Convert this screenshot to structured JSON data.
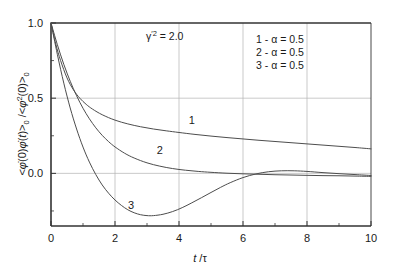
{
  "chart_data": {
    "type": "line",
    "title": "",
    "xlabel": "t/τ",
    "ylabel": "<φ̇(0)φ̇(t)>₀ / <φ̇²(0)>₀",
    "xlim": [
      0,
      10
    ],
    "ylim": [
      -0.35,
      1.0
    ],
    "grid": true,
    "x_ticks": [
      "0",
      "2",
      "4",
      "6",
      "8",
      "10"
    ],
    "x_tick_values": [
      0,
      2,
      4,
      6,
      8,
      10
    ],
    "y_ticks": [
      "0.0",
      "0.5",
      "1.0"
    ],
    "y_tick_values": [
      0.0,
      0.5,
      1.0
    ],
    "y_minor_ticks": [
      -0.25,
      0.25,
      0.75
    ],
    "annotations": [
      {
        "name": "gamma-prime-squared",
        "text": "γ'² = 2.0",
        "x": 2.2,
        "y": 0.87
      },
      {
        "name": "curve-tag-1",
        "text": "1",
        "x": 4.4,
        "y": 0.33
      },
      {
        "name": "curve-tag-2",
        "text": "2",
        "x": 3.4,
        "y": 0.13
      },
      {
        "name": "curve-tag-3",
        "text": "3",
        "x": 2.5,
        "y": -0.24
      }
    ],
    "legend": {
      "position": "top-right",
      "entries": [
        {
          "marker": "1",
          "separator": "-",
          "text": "1 - α = 0.5"
        },
        {
          "marker": "2",
          "separator": "-",
          "text": "2 - α = 0.5"
        },
        {
          "marker": "3",
          "separator": "-",
          "text": "3 - α = 0.5"
        }
      ]
    },
    "series": [
      {
        "name": "1",
        "label": "1 - α = 0.5",
        "color": "#4d4d4d",
        "x": [
          0,
          0.15,
          0.3,
          0.5,
          0.7,
          0.9,
          1.1,
          1.3,
          1.6,
          2.0,
          2.4,
          2.8,
          3.2,
          3.6,
          4.0,
          4.5,
          5.0,
          5.5,
          6.0,
          6.5,
          7.0,
          7.5,
          8.0,
          8.5,
          9.0,
          9.5,
          10.0
        ],
        "y": [
          1.0,
          0.86,
          0.75,
          0.635,
          0.556,
          0.5,
          0.459,
          0.427,
          0.39,
          0.354,
          0.329,
          0.31,
          0.295,
          0.283,
          0.272,
          0.259,
          0.248,
          0.238,
          0.229,
          0.22,
          0.212,
          0.204,
          0.196,
          0.188,
          0.18,
          0.172,
          0.163
        ]
      },
      {
        "name": "2",
        "label": "2 - α = 0.5",
        "color": "#4d4d4d",
        "x": [
          0,
          0.2,
          0.4,
          0.6,
          0.8,
          1.0,
          1.2,
          1.4,
          1.6,
          1.8,
          2.0,
          2.3,
          2.6,
          3.0,
          3.4,
          3.8,
          4.2,
          4.6,
          5.0,
          5.5,
          6.0,
          6.5,
          7.0,
          7.5,
          8.0,
          8.5,
          9.0,
          9.5,
          10.0
        ],
        "y": [
          1.0,
          0.855,
          0.725,
          0.613,
          0.516,
          0.433,
          0.363,
          0.303,
          0.253,
          0.211,
          0.176,
          0.134,
          0.102,
          0.07,
          0.048,
          0.032,
          0.021,
          0.013,
          0.007,
          0.001,
          -0.003,
          -0.006,
          -0.009,
          -0.011,
          -0.013,
          -0.015,
          -0.016,
          -0.018,
          -0.02
        ]
      },
      {
        "name": "3",
        "label": "3 - α = 0.5",
        "color": "#4d4d4d",
        "x": [
          0,
          0.2,
          0.4,
          0.6,
          0.8,
          1.0,
          1.2,
          1.4,
          1.6,
          1.8,
          2.0,
          2.2,
          2.4,
          2.6,
          2.8,
          3.0,
          3.2,
          3.5,
          3.8,
          4.1,
          4.4,
          4.7,
          5.0,
          5.3,
          5.6,
          6.0,
          6.4,
          6.8,
          7.2,
          7.6,
          8.0,
          8.5,
          9.0,
          9.5,
          10.0
        ],
        "y": [
          1.0,
          0.79,
          0.6,
          0.435,
          0.295,
          0.175,
          0.075,
          -0.008,
          -0.077,
          -0.132,
          -0.177,
          -0.213,
          -0.242,
          -0.262,
          -0.275,
          -0.281,
          -0.281,
          -0.272,
          -0.254,
          -0.228,
          -0.196,
          -0.162,
          -0.127,
          -0.093,
          -0.062,
          -0.028,
          -0.004,
          0.011,
          0.017,
          0.017,
          0.013,
          0.005,
          -0.002,
          -0.008,
          -0.014
        ]
      }
    ]
  },
  "figure": {
    "name": "velocity-autocorrelation-plot",
    "background": "#ffffff",
    "axis_color": "#333333",
    "grid_color": "#b3b3b3",
    "curve_color": "#4d4d4d"
  },
  "ylabel_parts": {
    "open1": "<",
    "phi1": "φ",
    "dot1": "̇",
    "arg1": "(0)",
    "phi2": "φ",
    "dot2": "̇",
    "arg2": "(t)>",
    "sub1": "0",
    "slash": " / ",
    "open2": "<",
    "phi3": "φ",
    "dot3": "̇",
    "sup2": "2",
    "arg3": "(0)>",
    "sub2": "0"
  },
  "xlabel_parts": {
    "t": "t",
    "slash": "/",
    "tau": "τ"
  },
  "gamma_parts": {
    "gamma": "γ",
    "primesq": "'2",
    "equals": " = 2.0"
  }
}
